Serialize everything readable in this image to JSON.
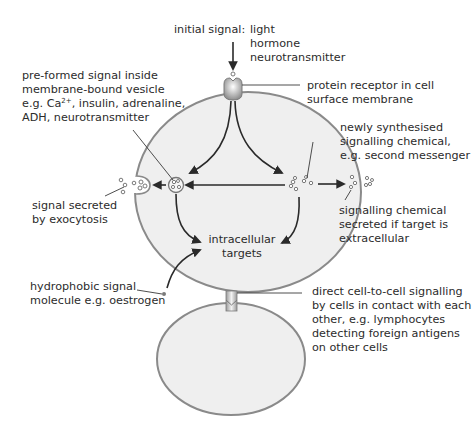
{
  "diagram": {
    "colors": {
      "cell_fill": "#efefef",
      "membrane": "#8a8a8a",
      "text": "#2b2b2b",
      "arrow": "#2a2a2a",
      "receptor": "#a8a8a8"
    },
    "labels": {
      "initial_signal": "initial signal:",
      "initial_signal_types": [
        "light",
        "hormone",
        "neurotransmitter"
      ],
      "receptor": [
        "protein receptor in cell",
        "surface membrane"
      ],
      "preformed": [
        "pre-formed signal inside",
        "membrane-bound  vesicle"
      ],
      "preformed_eg_prefix": "e.g. Ca",
      "preformed_eg_sup": "2+",
      "preformed_eg_suffix": ", insulin, adrenaline,",
      "preformed_last": "ADH, neurotransmitter",
      "newly_synthesised": [
        "newly synthesised",
        "signalling chemical,",
        "e.g. second messenger"
      ],
      "exocytosis": [
        "signal secreted",
        "by exocytosis"
      ],
      "secreted_extracellular": [
        "signalling chemical",
        "secreted if target is",
        "extracellular"
      ],
      "targets": [
        "intracellular",
        "targets"
      ],
      "hydrophobic": [
        "hydrophobic signal",
        "molecule e.g. oestrogen"
      ],
      "direct_contact": [
        "direct cell-to-cell signalling",
        "by cells in contact with each",
        "other, e.g. lymphocytes",
        "detecting foreign antigens",
        "on other cells"
      ]
    }
  }
}
